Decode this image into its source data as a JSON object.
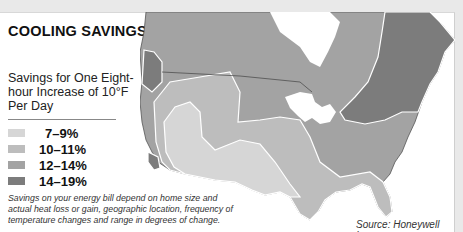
{
  "title": "COOLING SAVINGS",
  "subtitle": "Savings for One Eight-hour Increase of 10°F Per Day",
  "legend": {
    "items": [
      {
        "label": "7–9%",
        "color": "#d6d6d6"
      },
      {
        "label": "10–11%",
        "color": "#bdbdbd"
      },
      {
        "label": "12–14%",
        "color": "#a3a3a3"
      },
      {
        "label": "14–19%",
        "color": "#7c7c7c"
      }
    ]
  },
  "note": "Savings on your energy bill depend on home size and actual heat loss or gain, geographic location, frequency of temperature changes and range in degrees of change.",
  "source": "Source: Honeywell Inc.",
  "map": {
    "region": "North America (US & southern Canada)",
    "zones": [
      {
        "range": "7–9%",
        "area": "Southwest, southern Plains, Texas"
      },
      {
        "range": "10–11%",
        "area": "West coast interior, central Plains, Southeast, Florida"
      },
      {
        "range": "12–14%",
        "area": "Northern US, Midwest, Canada interior"
      },
      {
        "range": "14–19%",
        "area": "Pacific Northwest coast, Southern California coast, Northeast & eastern Canada"
      }
    ]
  }
}
